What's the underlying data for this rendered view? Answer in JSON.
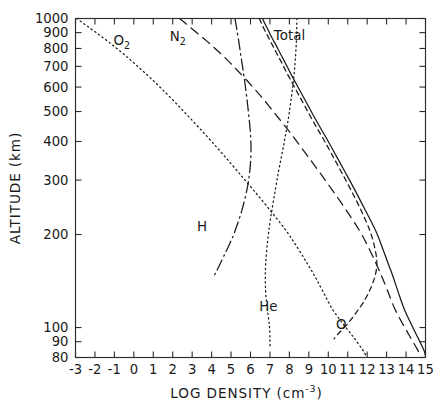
{
  "chart_data": {
    "type": "line",
    "title": "",
    "xlabel": "LOG DENSITY (cm-3)",
    "xlabel_main": "LOG DENSITY  (cm",
    "xlabel_exp": "-3",
    "xlabel_tail": ")",
    "ylabel": "ALTITUDE  (km)",
    "xlim": [
      -3,
      15
    ],
    "ylim": [
      80,
      1000
    ],
    "yscale": "log",
    "xscale": "linear",
    "grid": false,
    "legend": "inline-annotations",
    "xticks": [
      -3,
      -2,
      -1,
      0,
      1,
      2,
      3,
      4,
      5,
      6,
      7,
      8,
      9,
      10,
      11,
      12,
      13,
      14,
      15
    ],
    "xticklabels": [
      "-3",
      "-2",
      "-1",
      "0",
      "1",
      "2",
      "3",
      "4",
      "5",
      "6",
      "7",
      "8",
      "9",
      "10",
      "11",
      "12",
      "13",
      "14",
      "15"
    ],
    "yticks": [
      80,
      90,
      100,
      200,
      300,
      400,
      500,
      600,
      700,
      800,
      900,
      1000
    ],
    "yticklabels": [
      "80",
      "90",
      "100",
      "200",
      "300",
      "400",
      "500",
      "600",
      "700",
      "800",
      "900",
      "1000"
    ],
    "annotations": [
      {
        "text": "O",
        "sub": "2",
        "x": -1.05,
        "y": 820,
        "name": "o2-curve-label"
      },
      {
        "text": "N",
        "sub": "2",
        "x": 1.85,
        "y": 845,
        "name": "n2-curve-label"
      },
      {
        "text": "Total",
        "sub": "",
        "x": 7.2,
        "y": 855,
        "name": "total-curve-label"
      },
      {
        "text": "H",
        "sub": "",
        "x": 3.25,
        "y": 205,
        "name": "h-curve-label"
      },
      {
        "text": "He",
        "sub": "",
        "x": 6.45,
        "y": 113,
        "name": "he-curve-label"
      },
      {
        "text": "O",
        "sub": "",
        "x": 10.4,
        "y": 99,
        "name": "o-curve-label"
      }
    ],
    "series": [
      {
        "name": "Total",
        "style": "solid",
        "points": [
          [
            6.62,
            1000
          ],
          [
            6.75,
            960
          ],
          [
            6.9,
            920
          ],
          [
            7.05,
            880
          ],
          [
            7.22,
            840
          ],
          [
            7.4,
            800
          ],
          [
            7.58,
            760
          ],
          [
            7.78,
            720
          ],
          [
            7.98,
            680
          ],
          [
            8.2,
            640
          ],
          [
            8.44,
            600
          ],
          [
            8.7,
            560
          ],
          [
            8.98,
            520
          ],
          [
            9.28,
            480
          ],
          [
            9.62,
            440
          ],
          [
            10.0,
            400
          ],
          [
            10.4,
            360
          ],
          [
            10.85,
            320
          ],
          [
            11.35,
            280
          ],
          [
            11.9,
            240
          ],
          [
            12.45,
            205
          ],
          [
            12.8,
            180
          ],
          [
            13.1,
            160
          ],
          [
            13.35,
            145
          ],
          [
            13.6,
            130
          ],
          [
            13.9,
            115
          ],
          [
            14.25,
            103
          ],
          [
            14.6,
            93
          ],
          [
            14.9,
            85
          ],
          [
            15.0,
            81
          ]
        ]
      },
      {
        "name": "O",
        "style": "shortdash",
        "points": [
          [
            6.45,
            1000
          ],
          [
            6.58,
            960
          ],
          [
            6.72,
            920
          ],
          [
            6.88,
            880
          ],
          [
            7.04,
            840
          ],
          [
            7.22,
            800
          ],
          [
            7.4,
            760
          ],
          [
            7.6,
            720
          ],
          [
            7.8,
            680
          ],
          [
            8.02,
            640
          ],
          [
            8.26,
            600
          ],
          [
            8.52,
            560
          ],
          [
            8.8,
            520
          ],
          [
            9.1,
            480
          ],
          [
            9.44,
            440
          ],
          [
            9.82,
            400
          ],
          [
            10.22,
            360
          ],
          [
            10.66,
            320
          ],
          [
            11.15,
            280
          ],
          [
            11.68,
            240
          ],
          [
            12.15,
            205
          ],
          [
            12.4,
            180
          ],
          [
            12.5,
            162
          ],
          [
            12.42,
            148
          ],
          [
            12.2,
            135
          ],
          [
            11.85,
            122
          ],
          [
            11.4,
            111
          ],
          [
            10.95,
            102
          ],
          [
            10.55,
            96
          ],
          [
            10.3,
            92
          ]
        ]
      },
      {
        "name": "N2",
        "style": "dashed",
        "points": [
          [
            2.35,
            1000
          ],
          [
            2.7,
            960
          ],
          [
            3.05,
            920
          ],
          [
            3.42,
            880
          ],
          [
            3.8,
            840
          ],
          [
            4.18,
            800
          ],
          [
            4.56,
            760
          ],
          [
            4.94,
            720
          ],
          [
            5.32,
            680
          ],
          [
            5.72,
            640
          ],
          [
            6.12,
            600
          ],
          [
            6.54,
            560
          ],
          [
            6.96,
            520
          ],
          [
            7.4,
            480
          ],
          [
            7.88,
            440
          ],
          [
            8.38,
            400
          ],
          [
            8.92,
            360
          ],
          [
            9.52,
            320
          ],
          [
            10.18,
            280
          ],
          [
            10.92,
            240
          ],
          [
            11.62,
            205
          ],
          [
            12.1,
            180
          ],
          [
            12.48,
            160
          ],
          [
            12.78,
            145
          ],
          [
            13.08,
            130
          ],
          [
            13.42,
            115
          ],
          [
            13.82,
            103
          ],
          [
            14.22,
            93
          ],
          [
            14.58,
            85
          ],
          [
            14.72,
            81
          ]
        ]
      },
      {
        "name": "O2",
        "style": "dotted",
        "points": [
          [
            -2.95,
            1000
          ],
          [
            -2.55,
            960
          ],
          [
            -2.15,
            920
          ],
          [
            -1.72,
            880
          ],
          [
            -1.3,
            840
          ],
          [
            -0.88,
            800
          ],
          [
            -0.45,
            760
          ],
          [
            -0.02,
            720
          ],
          [
            0.42,
            680
          ],
          [
            0.88,
            640
          ],
          [
            1.34,
            600
          ],
          [
            1.82,
            560
          ],
          [
            2.32,
            520
          ],
          [
            2.84,
            480
          ],
          [
            3.4,
            440
          ],
          [
            4.0,
            400
          ],
          [
            4.64,
            360
          ],
          [
            5.34,
            320
          ],
          [
            6.12,
            280
          ],
          [
            7.0,
            240
          ],
          [
            7.85,
            205
          ],
          [
            8.45,
            180
          ],
          [
            8.95,
            160
          ],
          [
            9.35,
            145
          ],
          [
            9.75,
            130
          ],
          [
            10.2,
            115
          ],
          [
            10.75,
            103
          ],
          [
            11.3,
            93
          ],
          [
            11.75,
            85
          ],
          [
            11.95,
            81
          ]
        ]
      },
      {
        "name": "He",
        "style": "dotted",
        "points": [
          [
            8.38,
            1000
          ],
          [
            8.38,
            960
          ],
          [
            8.38,
            920
          ],
          [
            8.37,
            880
          ],
          [
            8.36,
            840
          ],
          [
            8.34,
            800
          ],
          [
            8.32,
            760
          ],
          [
            8.29,
            720
          ],
          [
            8.26,
            680
          ],
          [
            8.22,
            640
          ],
          [
            8.17,
            600
          ],
          [
            8.11,
            560
          ],
          [
            8.04,
            520
          ],
          [
            7.96,
            480
          ],
          [
            7.86,
            440
          ],
          [
            7.74,
            400
          ],
          [
            7.6,
            360
          ],
          [
            7.44,
            320
          ],
          [
            7.28,
            280
          ],
          [
            7.1,
            240
          ],
          [
            6.94,
            205
          ],
          [
            6.84,
            180
          ],
          [
            6.78,
            160
          ],
          [
            6.76,
            145
          ],
          [
            6.78,
            130
          ],
          [
            6.84,
            118
          ],
          [
            6.92,
            108
          ],
          [
            6.98,
            100
          ],
          [
            7.0,
            92
          ],
          [
            7.0,
            86
          ]
        ]
      },
      {
        "name": "H",
        "style": "dashdot",
        "points": [
          [
            5.2,
            1000
          ],
          [
            5.25,
            960
          ],
          [
            5.3,
            920
          ],
          [
            5.35,
            880
          ],
          [
            5.4,
            840
          ],
          [
            5.45,
            800
          ],
          [
            5.5,
            760
          ],
          [
            5.56,
            720
          ],
          [
            5.62,
            680
          ],
          [
            5.68,
            640
          ],
          [
            5.74,
            600
          ],
          [
            5.8,
            560
          ],
          [
            5.86,
            520
          ],
          [
            5.92,
            480
          ],
          [
            5.98,
            440
          ],
          [
            6.02,
            400
          ],
          [
            6.02,
            360
          ],
          [
            5.96,
            320
          ],
          [
            5.82,
            280
          ],
          [
            5.56,
            240
          ],
          [
            5.2,
            205
          ],
          [
            4.9,
            185
          ],
          [
            4.62,
            170
          ],
          [
            4.38,
            158
          ],
          [
            4.2,
            150
          ],
          [
            4.08,
            145
          ]
        ]
      }
    ]
  },
  "figure": {
    "background": "#ffffff",
    "foreground": "#1a1a1a"
  }
}
